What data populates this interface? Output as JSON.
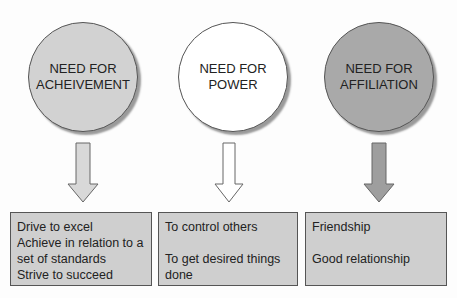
{
  "diagram": {
    "nodes": [
      {
        "id": "achievement",
        "title": "NEED FOR\nACHEIVEMENT",
        "fill": "#d2d2d2",
        "items": [
          "Drive to excel",
          "Achieve in relation to a set of standards",
          "Strive to succeed"
        ]
      },
      {
        "id": "power",
        "title": "NEED FOR\nPOWER",
        "fill": "#ffffff",
        "items": [
          "To control others",
          "To get desired things done"
        ]
      },
      {
        "id": "affiliation",
        "title": "NEED FOR\nAFFILIATION",
        "fill": "#a9a9a9",
        "items": [
          "Friendship",
          "Good relationship"
        ]
      }
    ],
    "arrow_fills": [
      "#d8d8d8",
      "#ffffff",
      "#9e9e9e"
    ],
    "box_fill": "#cfcfcf"
  }
}
